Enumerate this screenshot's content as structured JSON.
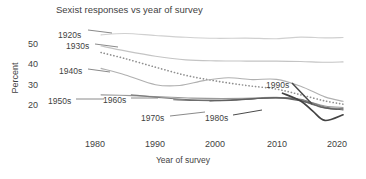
{
  "chart_data": {
    "type": "line",
    "title": "Sexist responses vs year of survey",
    "xlabel": "Year of survey",
    "ylabel": "Percent",
    "xlim": [
      1975,
      2022
    ],
    "ylim": [
      10,
      57
    ],
    "grid": false,
    "legend_position": "inline-labels",
    "xticks": [
      1980,
      1990,
      2000,
      2010,
      2020
    ],
    "yticks": [
      20,
      30,
      40,
      50
    ],
    "series": [
      {
        "name": "1920s",
        "style": "solid",
        "color": "#d0d0d0",
        "x": [
          1981,
          1985,
          1990,
          1995,
          2000,
          2005,
          2010,
          2014,
          2018,
          2021
        ],
        "values": [
          54.5,
          55.2,
          54.2,
          53.3,
          52.8,
          52.9,
          52.6,
          53.4,
          53.0,
          53.2
        ]
      },
      {
        "name": "1930s",
        "style": "solid",
        "color": "#c4c4c4",
        "x": [
          1981,
          1985,
          1990,
          1995,
          2000,
          2005,
          2010,
          2014,
          2018,
          2021
        ],
        "values": [
          49.0,
          46.6,
          44.0,
          42.2,
          41.7,
          41.6,
          41.6,
          41.4,
          41.0,
          41.2
        ]
      },
      {
        "name": "1930s-dotted",
        "style": "dotted",
        "color": "#8f8f8f",
        "x": [
          1981,
          1985,
          1990,
          1995,
          2000,
          2005,
          2010,
          2014,
          2018,
          2021
        ],
        "values": [
          45.8,
          42.8,
          38.6,
          34.6,
          31.8,
          29.6,
          27.8,
          25.0,
          22.0,
          20.4
        ]
      },
      {
        "name": "1940s",
        "style": "solid",
        "color": "#b0b0b0",
        "x": [
          1981,
          1985,
          1990,
          1994,
          1998,
          2002,
          2006,
          2010,
          2014,
          2018,
          2021
        ],
        "values": [
          38.0,
          34.8,
          30.0,
          29.6,
          32.0,
          33.4,
          32.5,
          32.6,
          29.2,
          24.0,
          21.8
        ]
      },
      {
        "name": "1950s",
        "style": "solid",
        "color": "#9a9a9a",
        "x": [
          1981,
          1986,
          1991,
          1996,
          2001,
          2006,
          2010,
          2014,
          2018,
          2021
        ],
        "values": [
          25.0,
          24.6,
          24.0,
          23.4,
          23.2,
          23.4,
          23.8,
          22.6,
          19.5,
          18.8
        ]
      },
      {
        "name": "1960s",
        "style": "solid",
        "color": "#7d7d7d",
        "x": [
          1986,
          1991,
          1996,
          2001,
          2006,
          2010,
          2014,
          2018,
          2021
        ],
        "values": [
          25.0,
          23.6,
          22.6,
          22.4,
          23.0,
          23.6,
          22.8,
          19.0,
          18.2
        ]
      },
      {
        "name": "1970s",
        "style": "solid",
        "color": "#6e6e6e",
        "x": [
          1993,
          1997,
          2001,
          2005,
          2009,
          2013,
          2017,
          2020
        ],
        "values": [
          22.6,
          22.2,
          22.2,
          22.8,
          23.6,
          23.0,
          19.2,
          17.8
        ]
      },
      {
        "name": "1980s",
        "style": "solid",
        "color": "#606060",
        "x": [
          1999,
          2003,
          2007,
          2011,
          2015,
          2018,
          2021
        ],
        "values": [
          22.0,
          22.4,
          23.2,
          23.4,
          21.4,
          18.6,
          17.6
        ]
      },
      {
        "name": "1990s",
        "style": "solid",
        "color": "#434343",
        "x": [
          2011,
          2014,
          2016,
          2018,
          2021
        ],
        "values": [
          25.8,
          22.0,
          17.0,
          12.4,
          15.2
        ]
      }
    ],
    "annotations": [
      {
        "text": "1920s",
        "x_px": 58,
        "y_px": 30
      },
      {
        "text": "1930s",
        "x_px": 66,
        "y_px": 41
      },
      {
        "text": "1940s",
        "x_px": 59,
        "y_px": 66
      },
      {
        "text": "1950s",
        "x_px": 48,
        "y_px": 96
      },
      {
        "text": "1960s",
        "x_px": 103,
        "y_px": 95
      },
      {
        "text": "1970s",
        "x_px": 141,
        "y_px": 113
      },
      {
        "text": "1980s",
        "x_px": 205,
        "y_px": 113
      },
      {
        "text": "1990s",
        "x_px": 266,
        "y_px": 80
      }
    ]
  }
}
